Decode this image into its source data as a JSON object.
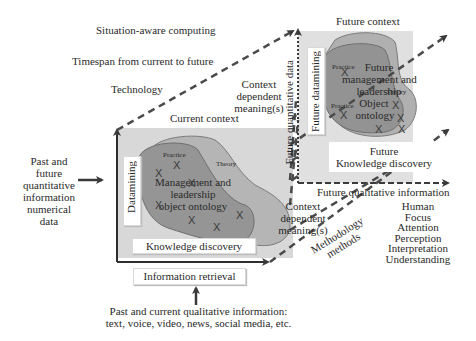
{
  "header_labels": {
    "situation_aware": "Situation-aware computing",
    "timespan": "Timespan from current to future",
    "technology": "Technology"
  },
  "left_input": {
    "lines": [
      "Past and",
      "future",
      "quantitative",
      "information",
      "numerical",
      "data"
    ]
  },
  "current_context": {
    "title": "Current context",
    "datamining": "Datamining",
    "practice": "Practice",
    "theory": "Theory",
    "ontology_lines": [
      "Management and",
      "leadership",
      "object ontology"
    ],
    "knowledge_discovery": "Knowledge discovery",
    "x_marks": "X"
  },
  "information_retrieval": "Information retrieval",
  "bottom_input": {
    "lines": [
      "Past and current qualitative information:",
      "text, voice, video, news, social media, etc."
    ]
  },
  "future_context": {
    "title": "Future context",
    "future_quantitative": "Future quantitative data",
    "future_datamining": "Future datamining",
    "practice_1": "Practice",
    "practice_2": "Practice",
    "theory": "Theory",
    "ontology_lines": [
      "Future",
      "management and",
      "leadership",
      "Object",
      "ontology"
    ],
    "knowledge_lines": [
      "Future",
      "Knowledge discovery"
    ]
  },
  "context_meaning_top": [
    "Context",
    "dependent",
    "meaning(s)"
  ],
  "context_meaning_bottom": [
    "Context",
    "dependent",
    "meaning(s)"
  ],
  "future_qualitative": "Future qualitative information",
  "methodology": [
    "Methodology",
    "methods"
  ],
  "human_factors": [
    "Human",
    "Focus",
    "Attention",
    "Perception",
    "Interpretation",
    "Understanding"
  ],
  "colors": {
    "panel_bg": "#d8d8d8",
    "blob_light": "#a9a9a9",
    "blob_dark": "#8c8c8c",
    "outline": "#6e6e6e",
    "arrow": "#3a3a3a"
  }
}
